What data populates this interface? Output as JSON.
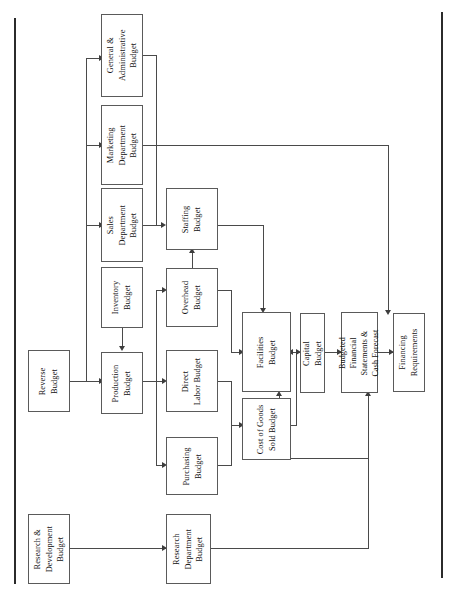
{
  "diagram": {
    "type": "flowchart",
    "orientation": "rotated-90-ccw",
    "colors": {
      "box_border": "#5a5a5a",
      "connector": "#4a4a4a",
      "frame_rule": "#2b2b2b",
      "background": "#ffffff",
      "text": "#111111"
    },
    "nodes": [
      {
        "id": "general_admin",
        "label": "General &\nAdministrative\nBudget"
      },
      {
        "id": "marketing",
        "label": "Marketing\nDepartment\nBudget"
      },
      {
        "id": "sales",
        "label": "Sales\nDepartment\nBudget"
      },
      {
        "id": "inventory",
        "label": "Inventory\nBudget"
      },
      {
        "id": "revenue",
        "label": "Reverse\nBudget"
      },
      {
        "id": "production",
        "label": "Production\nBudget"
      },
      {
        "id": "staffing",
        "label": "Staffing\nBudget"
      },
      {
        "id": "overhead",
        "label": "Overhead\nBudget"
      },
      {
        "id": "direct_labor",
        "label": "Direct\nLabor Budget"
      },
      {
        "id": "purchasing",
        "label": "Purchasing\nBudget"
      },
      {
        "id": "facilities",
        "label": "Facilities\nBudget"
      },
      {
        "id": "cogs",
        "label": "Cost of Goods\nSold Budget"
      },
      {
        "id": "capital",
        "label": "Capital\nBudget"
      },
      {
        "id": "budgeted_fs",
        "label": "Budgeted\nFinancial\nStatements &\nCash Forecast"
      },
      {
        "id": "financing",
        "label": "Financing\nRequirements"
      },
      {
        "id": "rnd",
        "label": "Research &\nDevelopment\nBudget"
      },
      {
        "id": "research_dept",
        "label": "Research\nDepartment\nBudget"
      }
    ],
    "edges": [
      {
        "from": "revenue",
        "to": "general_admin"
      },
      {
        "from": "revenue",
        "to": "marketing"
      },
      {
        "from": "revenue",
        "to": "sales"
      },
      {
        "from": "revenue",
        "to": "production"
      },
      {
        "from": "inventory",
        "to": "production"
      },
      {
        "from": "sales",
        "to": "staffing"
      },
      {
        "from": "general_admin",
        "to": "staffing"
      },
      {
        "from": "overhead",
        "to": "staffing"
      },
      {
        "from": "production",
        "to": "overhead"
      },
      {
        "from": "production",
        "to": "direct_labor"
      },
      {
        "from": "production",
        "to": "purchasing"
      },
      {
        "from": "overhead",
        "to": "facilities"
      },
      {
        "from": "direct_labor",
        "to": "cogs"
      },
      {
        "from": "purchasing",
        "to": "cogs"
      },
      {
        "from": "staffing",
        "to": "facilities"
      },
      {
        "from": "facilities",
        "to": "capital"
      },
      {
        "from": "cogs",
        "to": "capital"
      },
      {
        "from": "capital",
        "to": "budgeted_fs"
      },
      {
        "from": "marketing",
        "to": "budgeted_fs"
      },
      {
        "from": "research_dept",
        "to": "budgeted_fs"
      },
      {
        "from": "budgeted_fs",
        "to": "financing"
      },
      {
        "from": "rnd",
        "to": "research_dept"
      }
    ]
  }
}
